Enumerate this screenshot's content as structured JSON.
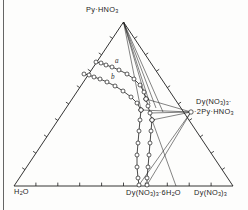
{
  "figure": {
    "type": "ternary-phase-diagram",
    "vertices": {
      "apex_label": "Py·HNO3",
      "left_label": "H2O",
      "right_label": "Dy(NO3)3"
    },
    "compound_labels": {
      "right_edge_line1": "Dy(NO3)3·",
      "right_edge_line2": "·2Py·HNO3",
      "bottom_hydrate": "Dy(NO3)3·6H2O"
    },
    "curve_tags": {
      "upper": "a",
      "lower": "b"
    },
    "colors": {
      "line": "#1d1d1d",
      "marker_fill": "#ffffff",
      "background": "#fdfdfc"
    }
  },
  "chart_data": {
    "type": "scatter",
    "title": "",
    "xlabel": "",
    "ylabel": "",
    "grid": false,
    "legend": "none",
    "triangle": {
      "apex": [
        123.5,
        22.0
      ],
      "left": [
        14.0,
        186.0
      ],
      "right": [
        233.0,
        186.0
      ],
      "ticks_per_side": 9
    },
    "annotations": [
      {
        "text": "Py·HNO3",
        "x": 123.5,
        "y": 12.0,
        "role": "vertex-label"
      },
      {
        "text": "H2O",
        "x": 22.0,
        "y": 193.0,
        "role": "vertex-label"
      },
      {
        "text": "Dy(NO3)3",
        "x": 214.0,
        "y": 193.0,
        "role": "vertex-label"
      },
      {
        "text": "Dy(NO3)3·2Py·HNO3",
        "x": 196.0,
        "y": 104.0,
        "role": "compound-label"
      },
      {
        "text": "Dy(NO3)3·6H2O",
        "x": 152.0,
        "y": 193.0,
        "role": "compound-label"
      },
      {
        "text": "a",
        "x": 115.0,
        "y": 60.0,
        "role": "curve-tag"
      },
      {
        "text": "b",
        "x": 111.0,
        "y": 76.0,
        "role": "curve-tag"
      }
    ],
    "series": [
      {
        "name": "a",
        "role": "isotherm-solubility-curve-upper",
        "points": [
          [
            96,
            62
          ],
          [
            101,
            63
          ],
          [
            106,
            65
          ],
          [
            112,
            67
          ],
          [
            119,
            70
          ],
          [
            127,
            74
          ],
          [
            134,
            79
          ],
          [
            140,
            85
          ],
          [
            144,
            92
          ],
          [
            146,
            99
          ]
        ]
      },
      {
        "name": "b",
        "role": "isotherm-solubility-curve-lower",
        "points": [
          [
            84,
            74
          ],
          [
            89,
            75
          ],
          [
            94,
            77
          ],
          [
            100,
            79
          ],
          [
            107,
            82
          ],
          [
            115,
            86
          ],
          [
            123,
            91
          ],
          [
            131,
            97
          ],
          [
            137,
            103
          ],
          [
            141,
            110
          ]
        ]
      },
      {
        "name": "c",
        "role": "branch-right-upper",
        "points": [
          [
            146,
            99
          ],
          [
            148,
            106
          ],
          [
            150,
            113
          ],
          [
            152,
            120
          ]
        ]
      },
      {
        "name": "d",
        "role": "branch-left-lower",
        "points": [
          [
            141,
            110
          ],
          [
            140,
            120
          ],
          [
            139,
            131
          ],
          [
            138,
            143
          ],
          [
            137,
            155
          ],
          [
            137,
            167
          ],
          [
            138,
            178
          ],
          [
            139,
            185
          ]
        ]
      },
      {
        "name": "e",
        "role": "branch-right-lower",
        "points": [
          [
            152,
            120
          ],
          [
            151,
            131
          ],
          [
            150,
            143
          ],
          [
            149,
            155
          ],
          [
            148,
            167
          ],
          [
            147,
            178
          ],
          [
            147,
            185
          ]
        ]
      }
    ],
    "tie_lines": [
      {
        "from": [
          123.5,
          22.0
        ],
        "to": [
          146,
          99
        ]
      },
      {
        "from": [
          123.5,
          22.0
        ],
        "to": [
          150,
          104
        ]
      },
      {
        "from": [
          123.5,
          22.0
        ],
        "to": [
          156,
          108
        ]
      },
      {
        "from": [
          123.5,
          22.0
        ],
        "to": [
          163,
          112
        ]
      },
      {
        "from": [
          123.5,
          22.0
        ],
        "to": [
          141,
          110
        ]
      },
      {
        "from": [
          191,
          112
        ],
        "to": [
          146,
          99
        ]
      },
      {
        "from": [
          191,
          112
        ],
        "to": [
          150,
          113
        ]
      },
      {
        "from": [
          191,
          112
        ],
        "to": [
          141,
          110
        ]
      },
      {
        "from": [
          191,
          112
        ],
        "to": [
          139,
          185
        ]
      },
      {
        "from": [
          191,
          112
        ],
        "to": [
          152,
          120
        ]
      },
      {
        "from": [
          191,
          112
        ],
        "to": [
          147,
          185
        ]
      },
      {
        "from": [
          152,
          120
        ],
        "to": [
          176,
          186
        ]
      }
    ],
    "invariant_points": [
      {
        "x": 146,
        "y": 99,
        "role": "node-upper"
      },
      {
        "x": 141,
        "y": 110,
        "role": "node-mid"
      },
      {
        "x": 152,
        "y": 120,
        "role": "node-lower"
      },
      {
        "x": 191,
        "y": 112,
        "role": "compound-point"
      }
    ]
  }
}
